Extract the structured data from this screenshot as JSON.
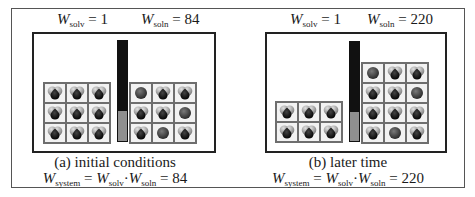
{
  "figure": {
    "panels": [
      {
        "id": "a",
        "w_solv_symbol": "W",
        "w_solv_sub": "solv",
        "w_solv_value": "= 1",
        "w_soln_symbol": "W",
        "w_soln_sub": "soln",
        "w_soln_value": "= 84",
        "caption": "(a) initial conditions",
        "equation": {
          "w_system": "W",
          "system_sub": "system",
          "eq1": " = ",
          "w_solv": "W",
          "solv_sub": "solv",
          "dot": "·",
          "w_soln": "W",
          "soln_sub": "soln",
          "result": " = 84"
        },
        "left_grid": {
          "rows": [
            [
              "solute",
              "solute",
              "solute"
            ],
            [
              "solute",
              "solute",
              "solute"
            ],
            [
              "solute",
              "solute",
              "solute"
            ]
          ]
        },
        "right_grid": {
          "rows": [
            [
              "solvent",
              "solute",
              "solute"
            ],
            [
              "solute",
              "solute",
              "solvent"
            ],
            [
              "solute",
              "solvent",
              "solute"
            ]
          ]
        },
        "bar_fill_fraction": 0.29
      },
      {
        "id": "b",
        "w_solv_symbol": "W",
        "w_solv_sub": "solv",
        "w_solv_value": "= 1",
        "w_soln_symbol": "W",
        "w_soln_sub": "soln",
        "w_soln_value": "= 220",
        "caption": "(b) later time",
        "equation": {
          "w_system": "W",
          "system_sub": "system",
          "eq1": " = ",
          "w_solv": "W",
          "solv_sub": "solv",
          "dot": "·",
          "w_soln": "W",
          "soln_sub": "soln",
          "result": " = 220"
        },
        "left_grid": {
          "rows": [
            [
              "solute",
              "solute",
              "solute"
            ],
            [
              "solute",
              "solute",
              "solute"
            ]
          ]
        },
        "right_grid": {
          "rows": [
            [
              "solvent",
              "solute",
              "solute"
            ],
            [
              "solute",
              "solute",
              "solvent"
            ],
            [
              "solute",
              "solute",
              "solute"
            ],
            [
              "solute",
              "solvent",
              "solute"
            ]
          ]
        },
        "bar_fill_fraction": 0.29
      }
    ],
    "colors": {
      "frame": "#555555",
      "box": "#222222",
      "grid_line": "#6e6e6e",
      "bar": "#111111",
      "bar_fill": "#8f8f8f"
    }
  }
}
